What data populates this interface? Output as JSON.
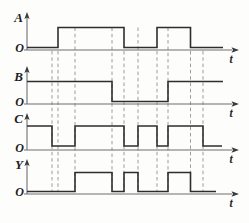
{
  "figure": {
    "type": "timing-diagram",
    "width": 249,
    "height": 223,
    "bg_color": "#fdfdfc",
    "wave_color": "#2e2e2e",
    "axis_color": "#6f6f6f",
    "dash_color": "#9c9c9c",
    "text_color": "#1e1e1e",
    "geometry": {
      "axis_x": 27,
      "wave_start_x": 27,
      "haxis_start_x": 24,
      "haxis_end_x": 232,
      "haxis_arrow_tip_x": 239,
      "signal_label_x": 23,
      "origin_label_x": 24,
      "t_label_x": 231
    },
    "panels": [
      {
        "label": "A",
        "origin_label": "O",
        "time_label": "t",
        "axis_y": 50,
        "arrow_top_y": 12,
        "label_y": 17,
        "high_y": 27.5,
        "low_y": 47.5,
        "start_level": "low",
        "toggle_x": [
          58,
          124,
          157,
          190.5
        ],
        "wave_end_x": 223
      },
      {
        "label": "B",
        "origin_label": "O",
        "time_label": "t",
        "axis_y": 104,
        "arrow_top_y": 66,
        "label_y": 76,
        "high_y": 81.5,
        "low_y": 101.5,
        "start_level": "high",
        "toggle_x": [
          112,
          168
        ],
        "wave_end_x": 223
      },
      {
        "label": "C",
        "origin_label": "O",
        "time_label": "t",
        "axis_y": 150,
        "arrow_top_y": 113,
        "label_y": 118,
        "high_y": 126,
        "low_y": 146,
        "start_level": "high",
        "toggle_x": [
          52,
          75,
          124,
          138,
          157,
          168,
          203
        ],
        "wave_end_x": 222
      },
      {
        "label": "Y",
        "origin_label": "O",
        "time_label": "t",
        "axis_y": 194,
        "arrow_top_y": 159,
        "label_y": 164,
        "high_y": 172.5,
        "low_y": 191.5,
        "start_level": "low",
        "toggle_x": [
          75,
          112,
          124,
          138,
          168,
          190.5
        ],
        "wave_end_x": 216
      }
    ],
    "dashed_lines": [
      {
        "x": 52,
        "top_y": 51,
        "bottom_y": 192
      },
      {
        "x": 58,
        "top_y": 51,
        "bottom_y": 192
      },
      {
        "x": 75,
        "top_y": 27.5,
        "bottom_y": 192
      },
      {
        "x": 112,
        "top_y": 27.5,
        "bottom_y": 192
      },
      {
        "x": 124,
        "top_y": 51,
        "bottom_y": 192
      },
      {
        "x": 138,
        "top_y": 27.5,
        "bottom_y": 192
      },
      {
        "x": 157,
        "top_y": 51,
        "bottom_y": 192
      },
      {
        "x": 168,
        "top_y": 27.5,
        "bottom_y": 192
      },
      {
        "x": 190.5,
        "top_y": 51,
        "bottom_y": 192
      },
      {
        "x": 203,
        "top_y": 51,
        "bottom_y": 192
      }
    ]
  }
}
